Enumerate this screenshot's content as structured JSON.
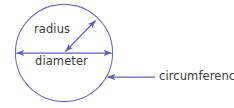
{
  "figure": {
    "background_color": "#ffffff",
    "stroke_color": "#6063ab",
    "circle_stroke_color": "#6f72b4",
    "text_color": "#3d3d3d",
    "width": 234,
    "height": 108
  },
  "circle": {
    "center_x": 64,
    "center_y": 53,
    "radius": 49,
    "stroke_width": 1.1
  },
  "labels": {
    "radius": "radius",
    "diameter": "diameter",
    "circumference": "circumference"
  },
  "annotations": [
    {
      "name": "radius",
      "label": "radius",
      "arrow_type": "double-headed",
      "from_x": 64,
      "from_y": 53,
      "to_x": 97,
      "to_y": 19
    },
    {
      "name": "diameter",
      "label": "diameter",
      "arrow_type": "double-headed",
      "from_x": 15,
      "from_y": 53,
      "to_x": 113,
      "to_y": 53
    },
    {
      "name": "circumference",
      "label": "circumference",
      "arrow_type": "single-headed",
      "from_x": 155,
      "from_y": 77,
      "to_x": 106,
      "to_y": 77
    }
  ]
}
